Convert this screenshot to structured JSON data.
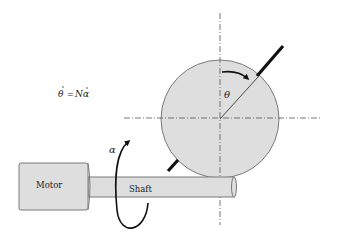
{
  "diagram": {
    "equation": "θ̇ = Nα̇",
    "equation_parts": {
      "lhs": "θ",
      "equals": "=",
      "rhs_coef": "N",
      "rhs_var": "α"
    },
    "motor_label": "Motor",
    "shaft_label": "Shaft",
    "alpha_label": "α",
    "theta_label": "θ"
  },
  "colors": {
    "fill": "#dedede",
    "outline": "#7a7a7a",
    "stroke": "#111111",
    "centerline": "#555555"
  }
}
